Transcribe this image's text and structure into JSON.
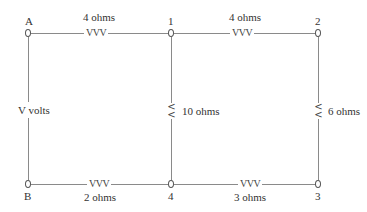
{
  "diagram": {
    "type": "circuit",
    "nodes": [
      {
        "id": "A",
        "label": "A"
      },
      {
        "id": "1",
        "label": "1"
      },
      {
        "id": "2",
        "label": "2"
      },
      {
        "id": "B",
        "label": "B"
      },
      {
        "id": "4",
        "label": "4"
      },
      {
        "id": "3",
        "label": "3"
      }
    ],
    "source": {
      "between": [
        "A",
        "B"
      ],
      "label": "V volts"
    },
    "resistors": [
      {
        "between": [
          "A",
          "1"
        ],
        "symbol": "VVV",
        "label": "4 ohms"
      },
      {
        "between": [
          "1",
          "2"
        ],
        "symbol": "VVV",
        "label": "4 ohms"
      },
      {
        "between": [
          "1",
          "4"
        ],
        "symbol": "<<",
        "label": "10 ohms"
      },
      {
        "between": [
          "2",
          "3"
        ],
        "symbol": "<<",
        "label": "6 ohms"
      },
      {
        "between": [
          "B",
          "4"
        ],
        "symbol": "VVV",
        "label": "2 ohms"
      },
      {
        "between": [
          "4",
          "3"
        ],
        "symbol": "VVV",
        "label": "3 ohms"
      }
    ]
  }
}
